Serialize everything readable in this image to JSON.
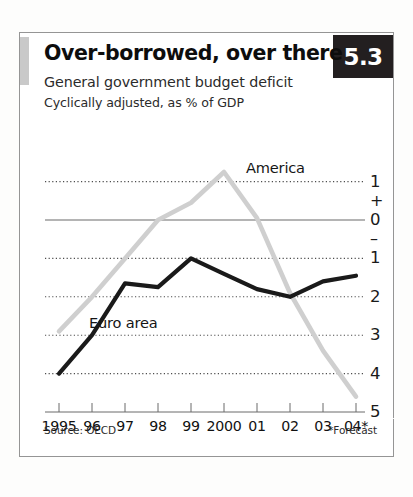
{
  "card": {
    "badge": "5.3",
    "title": "Over-borrowed, over there",
    "subtitle1": "General government budget deficit",
    "subtitle2": "Cyclically adjusted, as % of GDP",
    "source": "Source: OECD",
    "forecast_note": "*Forecast"
  },
  "colors": {
    "badge_bg": "#231f20",
    "badge_text": "#ffffff",
    "accent_bar": "#c9c9c9",
    "america_line": "#cfcfcf",
    "euro_line": "#1a1a1a",
    "gridline": "#4d4d4d",
    "zero_line": "#6b6b6b",
    "card_border": "#9c9c9c"
  },
  "chart_data": {
    "type": "line",
    "title": "Over-borrowed, over there",
    "subtitle": "General government budget deficit",
    "units": "Cyclically adjusted, as % of GDP",
    "xlabel": "",
    "ylabel": "",
    "x": [
      "1995",
      "96",
      "97",
      "98",
      "99",
      "2000",
      "01",
      "02",
      "03",
      "04*"
    ],
    "xticklabels": [
      "1995",
      "96",
      "97",
      "98",
      "99",
      "2000",
      "01",
      "02",
      "03",
      "04*"
    ],
    "ylim": [
      -5,
      1.4
    ],
    "yticks": [
      1,
      0,
      -1,
      -2,
      -3,
      -4,
      -5
    ],
    "yticklabels": [
      "1",
      "0",
      "1",
      "2",
      "3",
      "4",
      "5"
    ],
    "y_sign_positive": "+",
    "y_sign_negative": "–",
    "grid": true,
    "grid_style": "dotted",
    "gridlines_at": [
      1,
      -1,
      -2,
      -3,
      -4
    ],
    "zero_line": 0,
    "legend": "inline-labels",
    "series": [
      {
        "name": "America",
        "color": "#cfcfcf",
        "label_position": "upper-right",
        "values": [
          -2.9,
          -2.0,
          -1.0,
          0.0,
          0.45,
          1.25,
          0.05,
          -1.9,
          -3.4,
          -4.6
        ]
      },
      {
        "name": "Euro area",
        "color": "#1a1a1a",
        "label_position": "lower-left",
        "values": [
          -4.0,
          -3.0,
          -1.65,
          -1.75,
          -1.0,
          -1.4,
          -1.8,
          -2.0,
          -1.6,
          -1.45
        ]
      }
    ],
    "annotations": [
      {
        "text": "America",
        "series": "America"
      },
      {
        "text": "Euro area",
        "series": "Euro area"
      }
    ]
  }
}
